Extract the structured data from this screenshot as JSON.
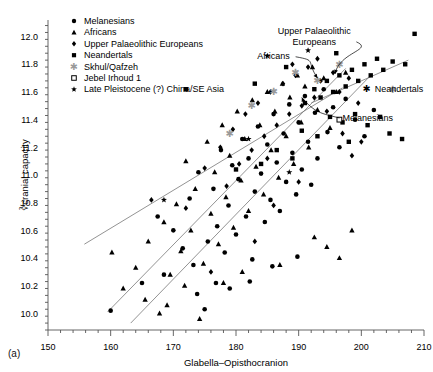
{
  "figure": {
    "panel_label": "(a)",
    "background": "#ffffff",
    "ink": "#000000",
    "axis_color": "#555555",
    "line_color": "#777777",
    "gray_marker": "#9a9a9a"
  },
  "chart_data": {
    "type": "scatter",
    "title": "",
    "xlabel": "Glabella–Opisthocranion",
    "ylabel": "∛cranial capacity",
    "xlim": [
      150,
      210
    ],
    "ylim": [
      9.88,
      12.12
    ],
    "xticks": [
      150,
      160,
      170,
      180,
      190,
      200,
      210
    ],
    "yticks": [
      10.0,
      10.2,
      10.4,
      10.6,
      10.8,
      11.0,
      11.2,
      11.4,
      11.6,
      11.8,
      12.0
    ],
    "x_minor_step": 2,
    "y_minor_step": 0.05,
    "grid": false,
    "legend_position": "top-left",
    "legend": [
      {
        "label": "Melanesians",
        "marker": "circle",
        "color": "#000000"
      },
      {
        "label": "Africans",
        "marker": "triangle",
        "color": "#000000"
      },
      {
        "label": "Upper Palaeolithic Europeans",
        "marker": "diamond",
        "color": "#000000"
      },
      {
        "label": "Neandertals",
        "marker": "square",
        "color": "#000000"
      },
      {
        "label": "Skhul/Qafzeh",
        "marker": "asterisk",
        "color": "#9a9a9a"
      },
      {
        "label": "Jebel Irhoud 1",
        "marker": "open-square",
        "color": "#000000"
      },
      {
        "label": "Late Pleistocene (?) China/SE Asia",
        "marker": "star",
        "color": "#000000"
      }
    ],
    "annotations": [
      {
        "text": "Upper Palaeolithic Europeans",
        "x": 192.5,
        "y": 12.02,
        "target_x": 195.8,
        "target_y": 11.73
      },
      {
        "text": "Africans",
        "x": 186.0,
        "y": 11.84,
        "target_x": 193.0,
        "target_y": 11.7
      },
      {
        "text": "Neandertals",
        "x": 201.5,
        "y": 11.6,
        "marker": "asterisk"
      },
      {
        "text": "Melanesians",
        "x": 197.0,
        "y": 11.39,
        "target_x": 190.5,
        "target_y": 11.56
      }
    ],
    "regression_lines": [
      {
        "name": "melanesians-line",
        "x1": 155.8,
        "y1": 10.5,
        "x2": 197.0,
        "y2": 11.63
      },
      {
        "name": "africans-line",
        "x1": 159.5,
        "y1": 10.01,
        "x2": 197.5,
        "y2": 11.77
      },
      {
        "name": "upper-palaeolithic-line",
        "x1": 163.2,
        "y1": 9.93,
        "x2": 201.5,
        "y2": 11.72
      },
      {
        "name": "neandertals-line",
        "x1": 192.0,
        "y1": 11.52,
        "x2": 207.5,
        "y2": 11.83
      }
    ],
    "series": [
      {
        "name": "Melanesians",
        "marker": "circle",
        "points": [
          [
            160.0,
            10.02
          ],
          [
            167.5,
            10.7
          ],
          [
            170.0,
            10.6
          ],
          [
            171.5,
            10.47
          ],
          [
            172.6,
            10.83
          ],
          [
            173.2,
            10.35
          ],
          [
            174.0,
            11.02
          ],
          [
            175.0,
            10.03
          ],
          [
            175.5,
            10.52
          ],
          [
            176.4,
            10.9
          ],
          [
            177.0,
            10.63
          ],
          [
            177.6,
            11.18
          ],
          [
            178.2,
            10.44
          ],
          [
            178.8,
            10.78
          ],
          [
            179.4,
            11.07
          ],
          [
            180.0,
            10.57
          ],
          [
            180.4,
            10.97
          ],
          [
            181.0,
            11.26
          ],
          [
            181.6,
            10.7
          ],
          [
            182.0,
            11.12
          ],
          [
            182.6,
            10.39
          ],
          [
            183.0,
            10.88
          ],
          [
            183.5,
            11.35
          ],
          [
            184.0,
            11.01
          ],
          [
            184.6,
            10.66
          ],
          [
            185.0,
            11.22
          ],
          [
            185.5,
            10.82
          ],
          [
            186.0,
            11.44
          ],
          [
            186.5,
            11.09
          ],
          [
            187.0,
            10.74
          ],
          [
            187.6,
            11.3
          ],
          [
            188.0,
            10.95
          ],
          [
            188.5,
            11.51
          ],
          [
            189.0,
            11.16
          ],
          [
            189.6,
            10.86
          ],
          [
            190.0,
            11.38
          ],
          [
            190.5,
            11.04
          ],
          [
            191.0,
            11.57
          ],
          [
            191.5,
            11.24
          ],
          [
            192.0,
            10.93
          ],
          [
            192.6,
            11.45
          ],
          [
            193.0,
            11.12
          ],
          [
            194.0,
            11.62
          ],
          [
            194.6,
            11.31
          ],
          [
            195.5,
            11.49
          ],
          [
            196.5,
            11.2
          ],
          [
            197.5,
            11.55
          ],
          [
            199.0,
            11.4
          ],
          [
            200.5,
            11.28
          ],
          [
            202.0,
            11.47
          ],
          [
            165.0,
            10.22
          ],
          [
            168.5,
            10.28
          ],
          [
            173.8,
            10.14
          ],
          [
            176.8,
            10.22
          ],
          [
            179.0,
            10.18
          ],
          [
            182.2,
            10.23
          ],
          [
            185.8,
            10.34
          ],
          [
            189.8,
            10.41
          ]
        ]
      },
      {
        "name": "Africans",
        "marker": "triangle",
        "points": [
          [
            160.2,
            10.44
          ],
          [
            162.0,
            10.18
          ],
          [
            164.0,
            10.33
          ],
          [
            166.0,
            10.52
          ],
          [
            167.8,
            10.0
          ],
          [
            168.5,
            10.66
          ],
          [
            169.5,
            10.28
          ],
          [
            170.5,
            10.79
          ],
          [
            171.2,
            10.45
          ],
          [
            172.0,
            11.1
          ],
          [
            172.8,
            10.6
          ],
          [
            173.5,
            10.9
          ],
          [
            174.2,
            9.96
          ],
          [
            174.8,
            10.36
          ],
          [
            175.4,
            11.24
          ],
          [
            176.0,
            10.72
          ],
          [
            176.6,
            11.02
          ],
          [
            177.2,
            10.5
          ],
          [
            177.8,
            11.36
          ],
          [
            178.4,
            10.84
          ],
          [
            179.0,
            11.14
          ],
          [
            179.6,
            10.62
          ],
          [
            180.2,
            11.46
          ],
          [
            180.8,
            10.96
          ],
          [
            181.4,
            11.26
          ],
          [
            182.0,
            10.74
          ],
          [
            182.6,
            11.54
          ],
          [
            183.2,
            11.06
          ],
          [
            183.8,
            11.36
          ],
          [
            184.4,
            10.86
          ],
          [
            185.0,
            11.6
          ],
          [
            185.6,
            11.18
          ],
          [
            186.2,
            11.46
          ],
          [
            186.8,
            10.98
          ],
          [
            187.4,
            11.66
          ],
          [
            188.0,
            11.28
          ],
          [
            188.6,
            11.56
          ],
          [
            189.2,
            11.08
          ],
          [
            189.8,
            11.72
          ],
          [
            190.4,
            11.38
          ],
          [
            191.0,
            11.64
          ],
          [
            191.6,
            11.2
          ],
          [
            192.2,
            11.78
          ],
          [
            193.0,
            11.47
          ],
          [
            194.0,
            11.7
          ],
          [
            195.0,
            11.34
          ],
          [
            196.0,
            11.6
          ],
          [
            197.5,
            11.74
          ],
          [
            165.5,
            10.1
          ],
          [
            169.0,
            10.06
          ],
          [
            171.8,
            10.2
          ],
          [
            178.0,
            10.22
          ],
          [
            181.0,
            10.3
          ],
          [
            187.0,
            10.35
          ],
          [
            192.5,
            10.55
          ],
          [
            194.5,
            10.48
          ],
          [
            196.5,
            10.4
          ],
          [
            198.5,
            10.6
          ]
        ]
      },
      {
        "name": "Upper Palaeolithic Europeans",
        "marker": "diamond",
        "points": [
          [
            166.5,
            10.82
          ],
          [
            172.0,
            10.76
          ],
          [
            175.0,
            11.05
          ],
          [
            177.5,
            11.2
          ],
          [
            178.5,
            10.92
          ],
          [
            179.5,
            11.33
          ],
          [
            180.5,
            11.08
          ],
          [
            181.5,
            11.44
          ],
          [
            182.5,
            11.18
          ],
          [
            183.5,
            11.52
          ],
          [
            184.5,
            11.28
          ],
          [
            185.5,
            11.6
          ],
          [
            186.5,
            11.36
          ],
          [
            187.5,
            11.66
          ],
          [
            188.5,
            11.44
          ],
          [
            189.5,
            11.72
          ],
          [
            190.5,
            11.5
          ],
          [
            191.5,
            11.78
          ],
          [
            192.5,
            11.56
          ],
          [
            193.5,
            11.68
          ],
          [
            194.5,
            11.46
          ],
          [
            195.5,
            11.74
          ],
          [
            196.5,
            11.6
          ],
          [
            198.0,
            11.7
          ],
          [
            199.5,
            11.52
          ],
          [
            193.0,
            11.84
          ],
          [
            189.0,
            11.8
          ],
          [
            185.0,
            11.12
          ],
          [
            197.0,
            11.3
          ],
          [
            198.5,
            11.14
          ],
          [
            200.0,
            11.24
          ],
          [
            186.0,
            10.78
          ],
          [
            190.0,
            10.95
          ],
          [
            176.0,
            10.3
          ],
          [
            183.0,
            10.52
          ]
        ]
      },
      {
        "name": "Neandertals",
        "marker": "square",
        "points": [
          [
            191.0,
            11.52
          ],
          [
            192.5,
            11.62
          ],
          [
            193.5,
            11.56
          ],
          [
            194.5,
            11.68
          ],
          [
            195.5,
            11.6
          ],
          [
            196.5,
            11.72
          ],
          [
            197.5,
            11.64
          ],
          [
            198.5,
            11.76
          ],
          [
            199.5,
            11.68
          ],
          [
            200.5,
            11.8
          ],
          [
            201.5,
            11.72
          ],
          [
            202.5,
            11.84
          ],
          [
            203.5,
            11.76
          ],
          [
            205.0,
            11.82
          ],
          [
            207.0,
            11.8
          ],
          [
            183.0,
            11.66
          ],
          [
            188.0,
            11.78
          ],
          [
            196.0,
            11.88
          ],
          [
            208.5,
            12.02
          ],
          [
            195.0,
            11.42
          ],
          [
            197.0,
            11.38
          ],
          [
            199.0,
            11.44
          ],
          [
            201.0,
            11.36
          ],
          [
            203.0,
            11.42
          ],
          [
            190.5,
            11.32
          ],
          [
            193.0,
            11.28
          ],
          [
            186.5,
            11.18
          ],
          [
            189.0,
            11.12
          ],
          [
            198.0,
            11.24
          ],
          [
            204.5,
            11.3
          ],
          [
            206.5,
            11.26
          ],
          [
            172.0,
            11.62
          ],
          [
            180.0,
            11.04
          ],
          [
            184.0,
            11.08
          ]
        ]
      },
      {
        "name": "Skhul/Qafzeh",
        "marker": "asterisk",
        "color": "#9a9a9a",
        "points": [
          [
            186.0,
            11.6
          ],
          [
            189.5,
            11.74
          ],
          [
            193.0,
            11.68
          ],
          [
            196.5,
            11.8
          ],
          [
            182.5,
            11.5
          ],
          [
            179.0,
            11.3
          ],
          [
            205.0,
            11.62
          ]
        ]
      },
      {
        "name": "Jebel Irhoud 1",
        "marker": "open-square",
        "points": [
          [
            196.5,
            11.4
          ]
        ]
      },
      {
        "name": "Late Pleistocene (?) China/SE Asia",
        "marker": "star",
        "points": [
          [
            168.5,
            10.82
          ],
          [
            185.0,
            11.86
          ],
          [
            191.5,
            11.9
          ],
          [
            182.0,
            11.26
          ],
          [
            188.5,
            11.02
          ]
        ]
      }
    ]
  }
}
